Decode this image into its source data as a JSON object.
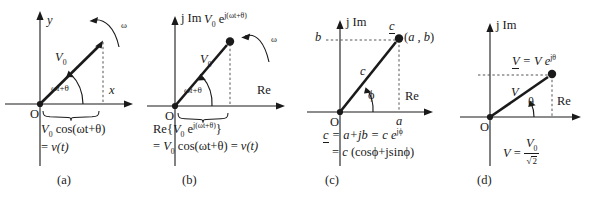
{
  "figure": {
    "kind": "phasor-diagram-set",
    "panel_count": 4,
    "ink_color": "#1a1a1a"
  },
  "panels": [
    {
      "id": "a",
      "caption": "(a)",
      "axis_y": "y",
      "axis_x": "x",
      "origin": "O",
      "vector_label": "V",
      "vector_sub": "0",
      "angle_label": "ωt+θ",
      "angle_label_parts": {
        "omega": "ω",
        "t": "t",
        "plus_theta": "+θ"
      },
      "rotation_label": "ω",
      "eq_line1_pre": "V",
      "eq_line1_sub": "0",
      "eq_line1_post": " cos(ωt+θ)",
      "eq_line2": "= v(t)",
      "eq_line2_eq": "= ",
      "eq_line2_v": "v",
      "eq_line2_t": "(t)"
    },
    {
      "id": "b",
      "caption": "(b)",
      "axis_y": "j Im",
      "axis_x": "Re",
      "origin": "O",
      "vector_label": "V",
      "vector_sub": "0",
      "angle_label": "ωt+θ",
      "rotation_label": "ω",
      "tip_label_v": "V",
      "tip_label_sub": "0",
      "tip_label_e": " e",
      "tip_label_exp": "j(ωt+θ)",
      "eq_line1_re": "Re{",
      "eq_line1_v": "V",
      "eq_line1_sub": "0",
      "eq_line1_e": " e",
      "eq_line1_exp": "j(ωt+θ)",
      "eq_line1_close": "}",
      "eq_line2_pre": "= V",
      "eq_line2_sub": "0",
      "eq_line2_post": " cos(ωt+θ) = ",
      "eq_line2_v": "v",
      "eq_line2_t": "(t)"
    },
    {
      "id": "c",
      "caption": "(c)",
      "axis_y": "j Im",
      "axis_x": "Re",
      "origin": "O",
      "vector_label": "c",
      "vector_label_underlined": "c",
      "angle_label": "ϕ",
      "tick_imag": "b",
      "tick_real": "a",
      "point_label": "(a , b)",
      "point_label_open": "(",
      "point_label_a": "a",
      "point_label_comma": " , ",
      "point_label_b": "b",
      "point_label_close": ")",
      "eq_line1_c": "c",
      "eq_line1_mid": " = a+jb = c e",
      "eq_line1_exp": "jϕ",
      "eq_line2": "= c (cosϕ+jsinϕ)",
      "eq_line2_eq": "= ",
      "eq_line2_c": "c",
      "eq_line2_rest": " (cosϕ+jsinϕ)"
    },
    {
      "id": "d",
      "caption": "(d)",
      "axis_y": "j Im",
      "axis_x": "Re",
      "origin": "O",
      "vector_label": "V",
      "angle_label": "θ",
      "tip_label_v": "V",
      "tip_label_eq": " = V e",
      "tip_label_exp": "jθ",
      "eq_v": "V",
      "eq_equals": " = ",
      "eq_num_v": "V",
      "eq_num_sub": "0",
      "eq_den_radical": "√",
      "eq_den_value": "2"
    }
  ]
}
